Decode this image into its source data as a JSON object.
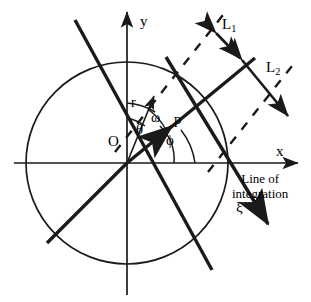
{
  "figure": {
    "type": "geometry-diagram",
    "title": "",
    "stroke_color": "#1a1a1a",
    "background_color": "#ffffff",
    "axes": {
      "x_label": "x",
      "y_label": "y",
      "origin_label": "O"
    },
    "circle": {
      "center_x": 127,
      "center_y": 163,
      "radius": 101
    },
    "angles": [
      {
        "name": "theta",
        "symbol": "θ"
      },
      {
        "name": "omega",
        "symbol": "ω"
      },
      {
        "name": "phi",
        "symbol": "ϕ"
      }
    ],
    "vectors": [
      {
        "name": "r",
        "symbol": "r"
      },
      {
        "name": "p",
        "symbol": "p"
      },
      {
        "name": "xi",
        "symbol": "ξ"
      }
    ],
    "segments": [
      {
        "name": "L1",
        "base": "L",
        "sub": "1"
      },
      {
        "name": "L2",
        "base": "L",
        "sub": "2"
      }
    ],
    "annotations": {
      "line_of_integration_line1": "Line of",
      "line_of_integration_line2": "integration"
    }
  }
}
